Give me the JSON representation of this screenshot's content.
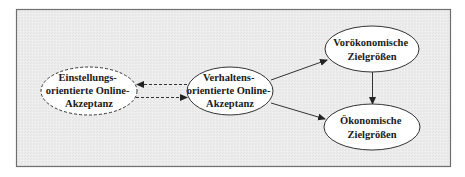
{
  "diagram": {
    "type": "flow-model",
    "frame": {
      "x": 16,
      "y": 9,
      "width": 434,
      "height": 157,
      "background": "#ebebeb",
      "border_color": "#6e6e6e"
    },
    "nodes": [
      {
        "id": "einstellungs",
        "lines": [
          "Einstellungs-",
          "orientierte Online-",
          "Akzeptanz"
        ],
        "cx": 89,
        "cy": 91,
        "rx": 48,
        "ry": 24,
        "border": "dashed"
      },
      {
        "id": "verhaltens",
        "lines": [
          "Verhaltens-",
          "orientierte Online-",
          "Akzeptanz"
        ],
        "cx": 230,
        "cy": 91,
        "rx": 43,
        "ry": 24,
        "border": "solid"
      },
      {
        "id": "voroekonomische",
        "lines": [
          "Vorökonomische",
          "Zielgrößen"
        ],
        "cx": 372,
        "cy": 49,
        "rx": 47,
        "ry": 23,
        "border": "solid"
      },
      {
        "id": "oekonomische",
        "lines": [
          "Ökonomische",
          "Zielgrößen"
        ],
        "cx": 372,
        "cy": 127,
        "rx": 48,
        "ry": 23,
        "border": "solid"
      }
    ],
    "edges": [
      {
        "from": "verhaltens",
        "to": "einstellungs",
        "style": "dashed"
      },
      {
        "from": "einstellungs",
        "to": "verhaltens",
        "style": "dashed"
      },
      {
        "from": "verhaltens",
        "to": "voroekonomische",
        "style": "solid"
      },
      {
        "from": "verhaltens",
        "to": "oekonomische",
        "style": "solid"
      },
      {
        "from": "voroekonomische",
        "to": "oekonomische",
        "style": "solid"
      }
    ],
    "colors": {
      "stroke": "#333333",
      "node_fill": "#ffffff",
      "text": "#1a1a1a"
    }
  }
}
